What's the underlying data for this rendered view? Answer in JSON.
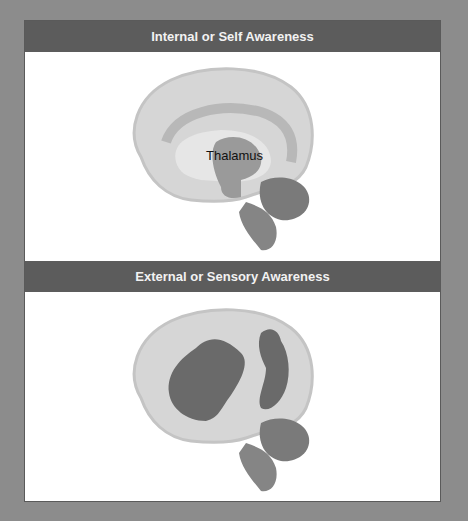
{
  "figure": {
    "panels": [
      {
        "title": "Internal or Self Awareness",
        "highlighted_region": "medial brain (cingulate / thalamus)",
        "labels": [
          {
            "text": "Thalamus"
          }
        ]
      },
      {
        "title": "External or Sensory Awareness",
        "highlighted_region": "lateral fronto-parietal cortex",
        "labels": []
      }
    ],
    "colors": {
      "background": "#8c8c8c",
      "header": "#5c5c5c",
      "brain_base": "#d4d4d4",
      "brain_highlight": "#6a6a6a",
      "thalamus": "#9a9a9a"
    }
  }
}
